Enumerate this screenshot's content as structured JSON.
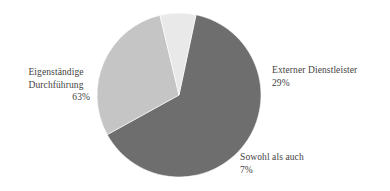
{
  "chart_data": {
    "type": "pie",
    "title": "",
    "subtitle": "",
    "xlabel": "",
    "ylabel": "",
    "legend_position": "none",
    "grid": false,
    "labels_outside": true,
    "categories": [
      "Eigenständige Durchführung",
      "Externer Dienstleister",
      "Sowohl als auch"
    ],
    "values": [
      63,
      29,
      7
    ],
    "value_suffix": "%",
    "colors": [
      "#6e6e6e",
      "#c5c5c5",
      "#e9e9e9"
    ],
    "start_angle_deg": 12,
    "direction": "clockwise",
    "slices": [
      {
        "name": "Eigenständige Durchführung",
        "name_line1": "Eigenständige",
        "name_line2": "Durchführung",
        "value": 63,
        "value_label": "63%",
        "color": "#6e6e6e",
        "label_position": "left"
      },
      {
        "name": "Externer Dienstleister",
        "name_line1": "Externer Dienstleister",
        "name_line2": "",
        "value": 29,
        "value_label": "29%",
        "color": "#c5c5c5",
        "label_position": "right"
      },
      {
        "name": "Sowohl als auch",
        "name_line1": "Sowohl als auch",
        "name_line2": "",
        "value": 7,
        "value_label": "7%",
        "color": "#e9e9e9",
        "label_position": "bottom-right"
      }
    ],
    "geometry": {
      "center_x": 179,
      "center_y": 95,
      "radius": 82
    },
    "background_color": "#ffffff"
  }
}
